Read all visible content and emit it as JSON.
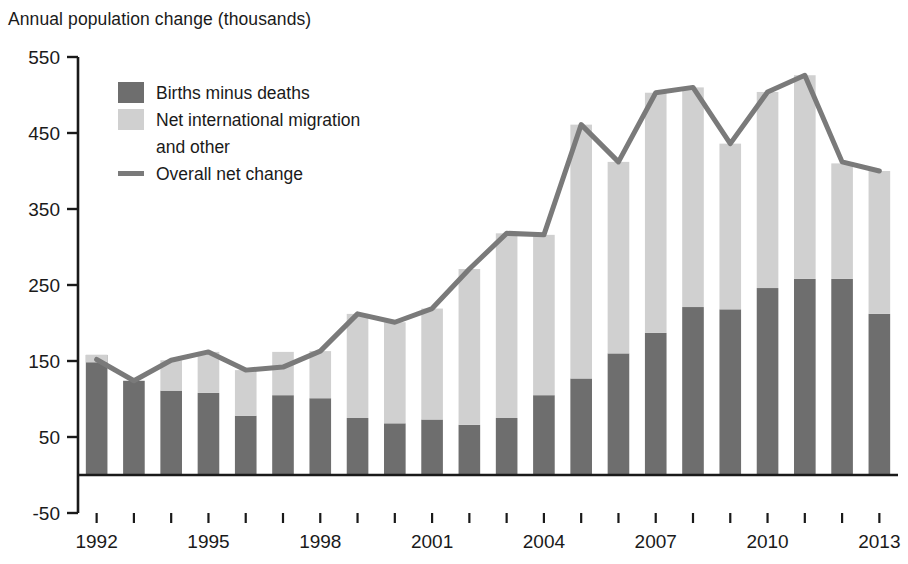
{
  "chart_data": {
    "type": "bar",
    "title": "",
    "ylabel": "Annual population change (thousands)",
    "xlabel": "",
    "ylim": [
      -50,
      550
    ],
    "ytick_values": [
      550,
      450,
      350,
      250,
      150,
      50,
      -50
    ],
    "ytick_labels": [
      "550",
      "450",
      "350",
      "250",
      "150",
      "50",
      "-50"
    ],
    "grid": false,
    "legend_position": "upper-left-inside",
    "stacked": true,
    "categories": [
      "1992",
      "1993",
      "1994",
      "1995",
      "1996",
      "1997",
      "1998",
      "1999",
      "2000",
      "2001",
      "2002",
      "2003",
      "2004",
      "2005",
      "2006",
      "2007",
      "2008",
      "2009",
      "2010",
      "2011",
      "2012",
      "2013"
    ],
    "xtick_labels_shown": [
      "1992",
      "1995",
      "1998",
      "2001",
      "2004",
      "2007",
      "2010",
      "2013"
    ],
    "series": [
      {
        "name": "Births minus deaths",
        "color": "#6e6e6e",
        "values": [
          158,
          124,
          111,
          108,
          78,
          105,
          101,
          75,
          68,
          73,
          66,
          75,
          105,
          127,
          160,
          187,
          221,
          218,
          246,
          258,
          258,
          212
        ]
      },
      {
        "name": "Net international migration and other",
        "color": "#d0d0d0",
        "values": [
          -10,
          0,
          40,
          54,
          60,
          57,
          62,
          137,
          133,
          146,
          205,
          243,
          211,
          334,
          252,
          316,
          289,
          218,
          258,
          268,
          152,
          188
        ]
      }
    ],
    "line_series": {
      "name": "Overall net change",
      "color": "#7a7a7a",
      "values": [
        152,
        124,
        151,
        162,
        138,
        142,
        163,
        212,
        201,
        219,
        271,
        318,
        316,
        461,
        412,
        503,
        510,
        436,
        504,
        526,
        412,
        400
      ]
    },
    "legend_entries": [
      {
        "label": "Births minus deaths",
        "type": "swatch",
        "color": "#6e6e6e"
      },
      {
        "label": "Net international migration",
        "label2": "and other",
        "type": "swatch",
        "color": "#d0d0d0"
      },
      {
        "label": "Overall net change",
        "type": "line",
        "color": "#7a7a7a"
      }
    ]
  },
  "icons": {
    "swatch_dark": "square-dark-swatch-icon",
    "swatch_light": "square-light-swatch-icon",
    "line_marker": "line-segment-icon"
  }
}
